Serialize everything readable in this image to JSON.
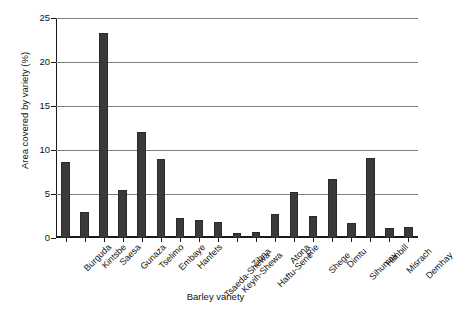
{
  "chart_data": {
    "type": "bar",
    "title": "",
    "xlabel": "Barley variety",
    "ylabel": "Area covered by variety (%)",
    "ylim": [
      0,
      25
    ],
    "yticks": [
      0,
      5,
      10,
      15,
      20,
      25
    ],
    "grid": true,
    "legend": "none",
    "bar_color": "#3a3a3a",
    "categories": [
      "Burguda",
      "Kintsbe",
      "Saesa",
      "Gunaza",
      "Tselimo",
      "Embaye",
      "Hanfets",
      "Tsaeda-Shewa",
      "Keyih-Shewa",
      "Zibna",
      "Haftu-Sene",
      "Atona",
      "Rie",
      "Shege",
      "Dimtu",
      "Sihumay",
      "Himbill",
      "Misrach",
      "Demhay"
    ],
    "values": [
      8.6,
      2.9,
      23.3,
      5.5,
      12.0,
      9.0,
      2.3,
      2.1,
      1.8,
      0.6,
      0.7,
      2.7,
      5.2,
      2.5,
      6.7,
      1.7,
      9.1,
      1.1,
      1.3
    ]
  },
  "axes": {
    "y_title": "Area covered by variety (%)",
    "x_title": "Barley variety"
  }
}
